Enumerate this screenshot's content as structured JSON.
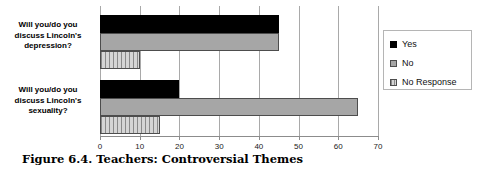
{
  "caption": "Figure 6.4.  Teachers: Controversial Themes",
  "legend": {
    "items": [
      {
        "label": "Yes",
        "swatch": "black-square-icon",
        "color": "#000000"
      },
      {
        "label": "No",
        "swatch": "gray-square-icon",
        "color": "#a6a6a6"
      },
      {
        "label": "No Response",
        "swatch": "hatched-square-icon",
        "color": "#c9c9c9"
      }
    ]
  },
  "axis": {
    "ticks": [
      "0",
      "10",
      "20",
      "30",
      "40",
      "50",
      "60",
      "70"
    ]
  },
  "categories": {
    "depression": {
      "line1": "Will you/do you",
      "line2": "discuss Lincoln's",
      "line3": "depression?"
    },
    "sexuality": {
      "line1": "Will you/do you",
      "line2": "discuss Lincoln's",
      "line3": "sexuality?"
    }
  },
  "chart_data": {
    "type": "bar",
    "orientation": "horizontal",
    "title": "Figure 6.4.  Teachers: Controversial Themes",
    "categories": [
      "Will you/do you discuss Lincoln's depression?",
      "Will you/do you discuss Lincoln's sexuality?"
    ],
    "series": [
      {
        "name": "Yes",
        "values": [
          45,
          20
        ],
        "color": "#000000"
      },
      {
        "name": "No",
        "values": [
          45,
          65
        ],
        "color": "#a6a6a6"
      },
      {
        "name": "No Response",
        "values": [
          10,
          15
        ],
        "color": "#c9c9c9"
      }
    ],
    "xlabel": "",
    "ylabel": "",
    "xlim": [
      0,
      70
    ],
    "xticks": [
      0,
      10,
      20,
      30,
      40,
      50,
      60,
      70
    ],
    "grid": "vertical",
    "legend_position": "right"
  }
}
